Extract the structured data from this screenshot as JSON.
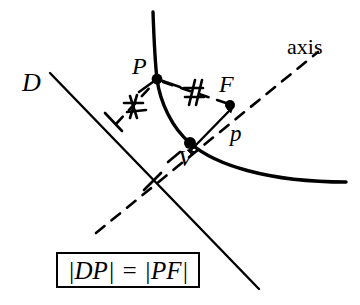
{
  "figure": {
    "background_color": "#ffffff",
    "ink_color": "#000000",
    "labels": {
      "directrix": "D",
      "point_on_curve": "P",
      "focus": "F",
      "vertex": "V",
      "focal_distance": "p",
      "axis": "axis"
    },
    "equation": "|DP| = |PF|",
    "tick_mark_glyph": "#",
    "elements": {
      "parabola": "solid curve opening to the right, vertex at V",
      "directrix_line": "solid straight line labeled D, upper-left to lower-right",
      "axis_line": "dashed line through V and F labeled axis",
      "segment_D_to_P": "dashed segment from directrix perpendicular foot to P, marked #",
      "segment_P_to_F": "dashed segment from P to F, marked #",
      "arrow_V_to_F": "double-headed arrow between V and F labeled p"
    }
  },
  "geometry": {
    "points": {
      "P": [
        157,
        78
      ],
      "F": [
        230,
        105
      ],
      "V": [
        190,
        143
      ],
      "foot_of_perpendicular_on_directrix": [
        113,
        122
      ],
      "axis_crosses_directrix": [
        152,
        182
      ]
    },
    "parabola_path": "M 153 12 L 157 78 Q 178 128 205 155 Q 265 186 345 183",
    "directrix_endpoints": [
      [
        50,
        74
      ],
      [
        258,
        288
      ]
    ],
    "axis_endpoints": [
      [
        96,
        232
      ],
      [
        318,
        52
      ]
    ]
  }
}
